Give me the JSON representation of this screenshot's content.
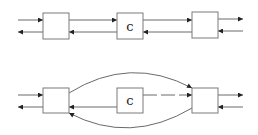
{
  "figure": {
    "width": 258,
    "height": 135,
    "colors": {
      "stroke": "#6a6a6a",
      "box_stroke": "#7a7a7a",
      "arrowhead": "#222222",
      "background": "#ffffff"
    }
  },
  "diagrams": [
    {
      "name": "top-diagram",
      "boxes": [
        {
          "id": "L1",
          "label": "",
          "x": 43,
          "y": 13,
          "w": 26,
          "h": 26
        },
        {
          "id": "C1",
          "label": "c",
          "x": 117,
          "y": 13,
          "w": 26,
          "h": 26
        },
        {
          "id": "R1",
          "label": "",
          "x": 192,
          "y": 12,
          "w": 26,
          "h": 26
        }
      ],
      "edges": [
        {
          "name": "in-left-upper",
          "d": "M 18 20 L 43 20",
          "arrow": "end"
        },
        {
          "name": "out-left-lower",
          "d": "M 43 32 L 18 32",
          "arrow": "end"
        },
        {
          "name": "L1-to-C1",
          "d": "M 69 20 L 117 20",
          "arrow": "end"
        },
        {
          "name": "C1-to-L1",
          "d": "M 117 32 L 69 32",
          "arrow": "end"
        },
        {
          "name": "C1-to-R1",
          "d": "M 143 20 L 192 20",
          "arrow": "end"
        },
        {
          "name": "R1-to-C1",
          "d": "M 192 32 L 143 32",
          "arrow": "end"
        },
        {
          "name": "out-right-upper",
          "d": "M 218 19 L 243 19",
          "arrow": "end"
        },
        {
          "name": "in-right-lower",
          "d": "M 243 31 L 218 31",
          "arrow": "end"
        }
      ]
    },
    {
      "name": "bottom-diagram",
      "boxes": [
        {
          "id": "L2",
          "label": "",
          "x": 43,
          "y": 88,
          "w": 26,
          "h": 25
        },
        {
          "id": "C2",
          "label": "c",
          "x": 117,
          "y": 88,
          "w": 26,
          "h": 25
        },
        {
          "id": "R2",
          "label": "",
          "x": 192,
          "y": 88,
          "w": 26,
          "h": 25
        }
      ],
      "edges": [
        {
          "name": "in-left-upper",
          "d": "M 18 95 L 43 95",
          "arrow": "end"
        },
        {
          "name": "out-left-lower",
          "d": "M 43 107 L 18 107",
          "arrow": "end"
        },
        {
          "name": "L2-arc-to-R2",
          "d": "M 69 93 Q 130 55 192 88",
          "arrow": "end"
        },
        {
          "name": "C2-to-R2-dashed",
          "d": "M 143 95 L 192 95",
          "arrow": "end",
          "dashed": true
        },
        {
          "name": "C2-to-L2",
          "d": "M 117 107 L 69 107",
          "arrow": "end"
        },
        {
          "name": "R2-arc-to-L2",
          "d": "M 192 108 Q 130 145 69 113",
          "arrow": "end"
        },
        {
          "name": "out-right-upper",
          "d": "M 218 95 L 243 95",
          "arrow": "end"
        },
        {
          "name": "in-right-lower",
          "d": "M 243 107 L 218 107",
          "arrow": "end"
        }
      ]
    }
  ]
}
